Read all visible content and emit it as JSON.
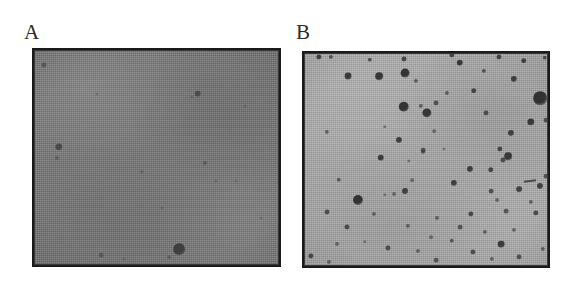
{
  "figure": {
    "name": "colony-formation-assay",
    "background_color": "#ffffff",
    "width": 573,
    "height": 286
  },
  "panels": [
    {
      "id": "panel-a",
      "label": "A",
      "label_x": 24,
      "label_y": 22,
      "plate": {
        "x": 32,
        "y": 48,
        "width": 249,
        "height": 219,
        "surface_color": "#797979",
        "border_color": "#1a1a1a",
        "colony_color": "#3a3a3a",
        "description": "sparse dark colonies on dark gray plate"
      },
      "colony_count_visible": 9,
      "colonies": [
        {
          "cx": 12,
          "cy": 17,
          "r": 2.6,
          "o": 0.55
        },
        {
          "cx": 27,
          "cy": 99,
          "r": 3.6,
          "o": 0.78
        },
        {
          "cx": 25,
          "cy": 110,
          "r": 2.0,
          "o": 0.42
        },
        {
          "cx": 65,
          "cy": 46,
          "r": 1.5,
          "o": 0.3
        },
        {
          "cx": 69,
          "cy": 207,
          "r": 2.3,
          "o": 0.5
        },
        {
          "cx": 92,
          "cy": 211,
          "r": 1.6,
          "o": 0.33
        },
        {
          "cx": 110,
          "cy": 124,
          "r": 1.7,
          "o": 0.35
        },
        {
          "cx": 130,
          "cy": 160,
          "r": 1.5,
          "o": 0.3
        },
        {
          "cx": 137,
          "cy": 209,
          "r": 1.8,
          "o": 0.36
        },
        {
          "cx": 147,
          "cy": 201,
          "r": 5.8,
          "o": 0.92
        },
        {
          "cx": 160,
          "cy": 49,
          "r": 1.6,
          "o": 0.32
        },
        {
          "cx": 166,
          "cy": 46,
          "r": 3.2,
          "o": 0.7
        },
        {
          "cx": 173,
          "cy": 115,
          "r": 2.1,
          "o": 0.45
        },
        {
          "cx": 184,
          "cy": 133,
          "r": 1.5,
          "o": 0.3
        },
        {
          "cx": 204,
          "cy": 133,
          "r": 1.5,
          "o": 0.28
        },
        {
          "cx": 213,
          "cy": 58,
          "r": 1.4,
          "o": 0.26
        },
        {
          "cx": 229,
          "cy": 170,
          "r": 1.5,
          "o": 0.28
        }
      ],
      "scratches": []
    },
    {
      "id": "panel-b",
      "label": "B",
      "label_x": 296,
      "label_y": 22,
      "plate": {
        "x": 302,
        "y": 51,
        "width": 248,
        "height": 217,
        "surface_color": "#acacac",
        "border_color": "#1a1a1a",
        "colony_color": "#2e2e2e",
        "description": "numerous dark colonies densely scattered on light gray plate"
      },
      "colony_count_visible": 78,
      "colonies": [
        {
          "cx": 17,
          "cy": 6,
          "r": 2.6,
          "o": 0.85
        },
        {
          "cx": 29,
          "cy": 6,
          "r": 2.1,
          "o": 0.7
        },
        {
          "cx": 68,
          "cy": 9,
          "r": 2.2,
          "o": 0.72
        },
        {
          "cx": 102,
          "cy": 8,
          "r": 2.4,
          "o": 0.8
        },
        {
          "cx": 150,
          "cy": 4,
          "r": 2.6,
          "o": 0.82
        },
        {
          "cx": 158,
          "cy": 12,
          "r": 3.2,
          "o": 0.9
        },
        {
          "cx": 182,
          "cy": 20,
          "r": 2.1,
          "o": 0.68
        },
        {
          "cx": 197,
          "cy": 6,
          "r": 2.5,
          "o": 0.8
        },
        {
          "cx": 222,
          "cy": 10,
          "r": 2.7,
          "o": 0.82
        },
        {
          "cx": 243,
          "cy": 7,
          "r": 2.2,
          "o": 0.72
        },
        {
          "cx": 46,
          "cy": 25,
          "r": 3.4,
          "o": 0.9
        },
        {
          "cx": 77,
          "cy": 25,
          "r": 3.8,
          "o": 0.92
        },
        {
          "cx": 103,
          "cy": 22,
          "r": 4.4,
          "o": 0.95
        },
        {
          "cx": 114,
          "cy": 30,
          "r": 2.0,
          "o": 0.6
        },
        {
          "cx": 212,
          "cy": 28,
          "r": 3.1,
          "o": 0.85
        },
        {
          "cx": 145,
          "cy": 42,
          "r": 2.0,
          "o": 0.6
        },
        {
          "cx": 172,
          "cy": 40,
          "r": 2.7,
          "o": 0.8
        },
        {
          "cx": 119,
          "cy": 55,
          "r": 2.1,
          "o": 0.62
        },
        {
          "cx": 102,
          "cy": 56,
          "r": 5.2,
          "o": 0.95
        },
        {
          "cx": 125,
          "cy": 62,
          "r": 4.6,
          "o": 0.93
        },
        {
          "cx": 134,
          "cy": 52,
          "r": 2.4,
          "o": 0.7
        },
        {
          "cx": 184,
          "cy": 62,
          "r": 2.4,
          "o": 0.72
        },
        {
          "cx": 238,
          "cy": 47,
          "r": 6.8,
          "o": 0.96
        },
        {
          "cx": 229,
          "cy": 71,
          "r": 3.6,
          "o": 0.9
        },
        {
          "cx": 244,
          "cy": 69,
          "r": 2.3,
          "o": 0.72
        },
        {
          "cx": 25,
          "cy": 81,
          "r": 2.1,
          "o": 0.6
        },
        {
          "cx": 83,
          "cy": 76,
          "r": 1.7,
          "o": 0.48
        },
        {
          "cx": 132,
          "cy": 80,
          "r": 1.8,
          "o": 0.5
        },
        {
          "cx": 209,
          "cy": 82,
          "r": 3.0,
          "o": 0.85
        },
        {
          "cx": 97,
          "cy": 89,
          "r": 3.0,
          "o": 0.85
        },
        {
          "cx": 198,
          "cy": 98,
          "r": 2.6,
          "o": 0.78
        },
        {
          "cx": 121,
          "cy": 99,
          "r": 2.3,
          "o": 0.7
        },
        {
          "cx": 201,
          "cy": 109,
          "r": 2.5,
          "o": 0.74
        },
        {
          "cx": 189,
          "cy": 119,
          "r": 2.7,
          "o": 0.8
        },
        {
          "cx": 168,
          "cy": 118,
          "r": 3.0,
          "o": 0.85
        },
        {
          "cx": 121,
          "cy": 101,
          "r": 1.9,
          "o": 0.52
        },
        {
          "cx": 79,
          "cy": 107,
          "r": 3.2,
          "o": 0.88
        },
        {
          "cx": 107,
          "cy": 110,
          "r": 1.6,
          "o": 0.45
        },
        {
          "cx": 142,
          "cy": 98,
          "r": 1.5,
          "o": 0.4
        },
        {
          "cx": 206,
          "cy": 105,
          "r": 3.8,
          "o": 0.9
        },
        {
          "cx": 244,
          "cy": 125,
          "r": 2.3,
          "o": 0.7
        },
        {
          "cx": 37,
          "cy": 129,
          "r": 2.2,
          "o": 0.66
        },
        {
          "cx": 110,
          "cy": 129,
          "r": 1.8,
          "o": 0.5
        },
        {
          "cx": 152,
          "cy": 132,
          "r": 3.1,
          "o": 0.86
        },
        {
          "cx": 189,
          "cy": 140,
          "r": 2.3,
          "o": 0.7
        },
        {
          "cx": 217,
          "cy": 138,
          "r": 2.8,
          "o": 0.82
        },
        {
          "cx": 238,
          "cy": 135,
          "r": 3.0,
          "o": 0.85
        },
        {
          "cx": 103,
          "cy": 140,
          "r": 2.9,
          "o": 0.84
        },
        {
          "cx": 56,
          "cy": 149,
          "r": 5.0,
          "o": 0.95
        },
        {
          "cx": 83,
          "cy": 144,
          "r": 1.7,
          "o": 0.46
        },
        {
          "cx": 92,
          "cy": 143,
          "r": 1.9,
          "o": 0.5
        },
        {
          "cx": 195,
          "cy": 149,
          "r": 1.9,
          "o": 0.52
        },
        {
          "cx": 229,
          "cy": 151,
          "r": 2.1,
          "o": 0.6
        },
        {
          "cx": 25,
          "cy": 161,
          "r": 2.4,
          "o": 0.72
        },
        {
          "cx": 72,
          "cy": 163,
          "r": 2.0,
          "o": 0.56
        },
        {
          "cx": 135,
          "cy": 167,
          "r": 2.0,
          "o": 0.58
        },
        {
          "cx": 169,
          "cy": 163,
          "r": 2.6,
          "o": 0.78
        },
        {
          "cx": 204,
          "cy": 160,
          "r": 2.3,
          "o": 0.68
        },
        {
          "cx": 234,
          "cy": 162,
          "r": 2.6,
          "o": 0.78
        },
        {
          "cx": 45,
          "cy": 176,
          "r": 2.5,
          "o": 0.74
        },
        {
          "cx": 106,
          "cy": 175,
          "r": 2.1,
          "o": 0.6
        },
        {
          "cx": 158,
          "cy": 176,
          "r": 2.3,
          "o": 0.68
        },
        {
          "cx": 183,
          "cy": 181,
          "r": 2.1,
          "o": 0.6
        },
        {
          "cx": 212,
          "cy": 179,
          "r": 2.0,
          "o": 0.56
        },
        {
          "cx": 129,
          "cy": 186,
          "r": 1.8,
          "o": 0.5
        },
        {
          "cx": 150,
          "cy": 190,
          "r": 2.2,
          "o": 0.64
        },
        {
          "cx": 199,
          "cy": 193,
          "r": 3.3,
          "o": 0.88
        },
        {
          "cx": 63,
          "cy": 191,
          "r": 1.7,
          "o": 0.46
        },
        {
          "cx": 35,
          "cy": 193,
          "r": 2.0,
          "o": 0.55
        },
        {
          "cx": 86,
          "cy": 197,
          "r": 2.5,
          "o": 0.75
        },
        {
          "cx": 116,
          "cy": 200,
          "r": 2.0,
          "o": 0.56
        },
        {
          "cx": 171,
          "cy": 201,
          "r": 2.5,
          "o": 0.74
        },
        {
          "cx": 241,
          "cy": 198,
          "r": 2.1,
          "o": 0.6
        },
        {
          "cx": 9,
          "cy": 205,
          "r": 2.6,
          "o": 0.78
        },
        {
          "cx": 27,
          "cy": 211,
          "r": 2.0,
          "o": 0.56
        },
        {
          "cx": 134,
          "cy": 209,
          "r": 2.3,
          "o": 0.66
        },
        {
          "cx": 190,
          "cy": 208,
          "r": 2.1,
          "o": 0.6
        },
        {
          "cx": 217,
          "cy": 206,
          "r": 2.4,
          "o": 0.7
        }
      ],
      "scratches": [
        {
          "x": 222,
          "y": 129,
          "w": 12,
          "h": 2,
          "rot": -8
        }
      ]
    }
  ]
}
